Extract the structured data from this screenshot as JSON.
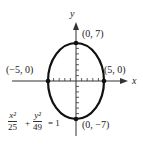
{
  "axes": {
    "x_label": "x",
    "y_label": "y"
  },
  "points": {
    "top": "(0, 7)",
    "bottom": "(0, −7)",
    "left": "(−5, 0)",
    "right": "(5, 0)"
  },
  "equation": {
    "term1_num": "x²",
    "term1_den": "25",
    "plus": "+",
    "term2_num": "y²",
    "term2_den": "49",
    "rhs": "= 1"
  },
  "colors": {
    "stroke": "#111111"
  }
}
